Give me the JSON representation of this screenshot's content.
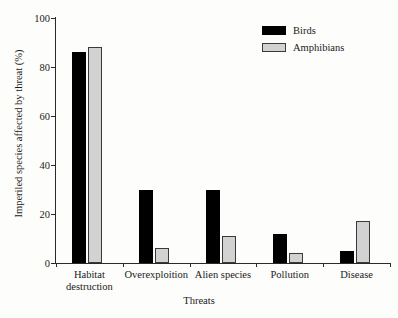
{
  "chart_data": {
    "type": "bar",
    "title": "",
    "xlabel": "Threats",
    "ylabel": "Imperiled species affected by threat (%)",
    "categories": [
      "Habitat destruction",
      "Overexploition",
      "Alien species",
      "Pollution",
      "Disease"
    ],
    "category_lines": [
      [
        "Habitat",
        "destruction"
      ],
      [
        "Overexploition",
        ""
      ],
      [
        "Alien species",
        ""
      ],
      [
        "Pollution",
        ""
      ],
      [
        "Disease",
        ""
      ]
    ],
    "series": [
      {
        "name": "Birds",
        "color": "#000000",
        "values": [
          86,
          30,
          30,
          12,
          5
        ]
      },
      {
        "name": "Amphibians",
        "color": "#d2d2d2",
        "values": [
          88,
          6,
          11,
          4,
          17
        ]
      }
    ],
    "ylim": [
      0,
      100
    ],
    "yticks": [
      0,
      20,
      40,
      60,
      80,
      100
    ],
    "ytick_labels": [
      "0",
      "20",
      "40",
      "60",
      "80",
      "100"
    ],
    "grid": false,
    "legend_position": "top-right"
  },
  "legend": {
    "entries": [
      {
        "label": "Birds",
        "swatch": "black-square-swatch"
      },
      {
        "label": "Amphibians",
        "swatch": "gray-square-swatch"
      }
    ]
  },
  "axes": {
    "x_title": "Threats",
    "y_title": "Imperiled species affected by threat (%)"
  }
}
